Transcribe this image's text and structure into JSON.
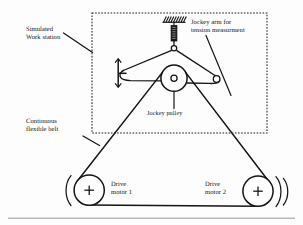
{
  "figure": {
    "background_color": "#fdfdfd",
    "ink_color": "#141414"
  },
  "labels": {
    "workstation": "Simulated\nWork station",
    "jockey_arm": "Jockey arm for\ntension measurment",
    "jockey_pulley": "Jockey pulley",
    "belt": "Continuous\nflexible belt",
    "motor1": "Drive\nmotor 1",
    "motor2": "Drive\nmotor 2"
  },
  "components": {
    "enclosure": {
      "name": "simulated-work-station-boundary",
      "style": "dashed-rectangle",
      "x": 92,
      "y": 13,
      "width": 175,
      "height": 120
    },
    "ceiling_mount": {
      "name": "hatched-ground-support",
      "x": 163,
      "y": 16,
      "width": 22,
      "height": 6,
      "hatch_count": 9
    },
    "tension_sensor": {
      "name": "spring-load-cell",
      "x": 171,
      "y": 24,
      "width": 6,
      "height": 16
    },
    "arm_pivot": {
      "name": "arm-pivot-joint",
      "cx": 174,
      "cy": 48,
      "r": 2.6
    },
    "jockey_pulley": {
      "name": "jockey-pulley",
      "cx": 174,
      "cy": 78,
      "r": 13,
      "hub_r": 3
    },
    "arm_left_end": {
      "name": "arm-left-stop-bracket",
      "x": 118,
      "y": 60,
      "height": 26
    },
    "arm_right_end": {
      "name": "arm-right-roller",
      "cx": 217,
      "cy": 79,
      "r": 3.2
    },
    "motor1": {
      "name": "drive-motor-1-pulley",
      "cx": 89,
      "cy": 190,
      "r": 15,
      "marker": "+"
    },
    "motor2": {
      "name": "drive-motor-2-pulley",
      "cx": 258,
      "cy": 191,
      "r": 15,
      "marker": "+"
    },
    "belt": {
      "name": "continuous-flexible-belt",
      "path_description": "triangular loop around jockey pulley and both drive motor pulleys"
    },
    "rotation_arc_left": {
      "name": "motor-1-rotation-arc"
    },
    "rotation_arc_right": {
      "name": "motor-2-rotation-arc"
    },
    "baseline_rule": {
      "name": "page-baseline-rule",
      "y": 218
    }
  }
}
